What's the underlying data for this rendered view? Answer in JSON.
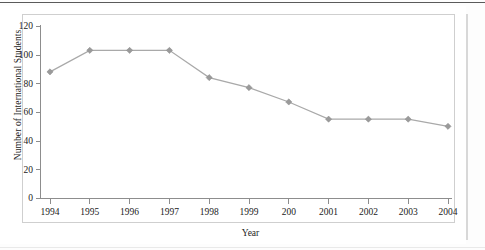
{
  "figure": {
    "kind": "line-chart-figure",
    "background_color": "#ffffff",
    "frame_color": "#cfcfcf",
    "top_rule_color": "#5a5a5a"
  },
  "chart_data": {
    "type": "line",
    "title": "",
    "subtitle": "",
    "xlabel": "Year",
    "ylabel": "Number of International Students",
    "categories": [
      "1994",
      "1995",
      "1996",
      "1997",
      "1998",
      "1999",
      "200",
      "2001",
      "2002",
      "2003",
      "2004"
    ],
    "x_tick_labels": [
      "1994",
      "1995",
      "1996",
      "1997",
      "1998",
      "1999",
      "200",
      "2001",
      "2002",
      "2003",
      "2004"
    ],
    "y_tick_labels": [
      "0",
      "20",
      "40",
      "60",
      "80",
      "100",
      "120"
    ],
    "y_ticks": [
      0,
      20,
      40,
      60,
      80,
      100,
      120
    ],
    "values": [
      88,
      103,
      103,
      103,
      84,
      77,
      67,
      55,
      55,
      55,
      50
    ],
    "series": [
      {
        "name": "Number of International Students",
        "values": [
          88,
          103,
          103,
          103,
          84,
          77,
          67,
          55,
          55,
          55,
          50
        ],
        "color": "#a9a9a9",
        "marker": "diamond",
        "marker_color": "#9a9a9a"
      }
    ],
    "ylim": [
      0,
      120
    ],
    "grid": false,
    "legend": false,
    "legend_position": "none"
  }
}
